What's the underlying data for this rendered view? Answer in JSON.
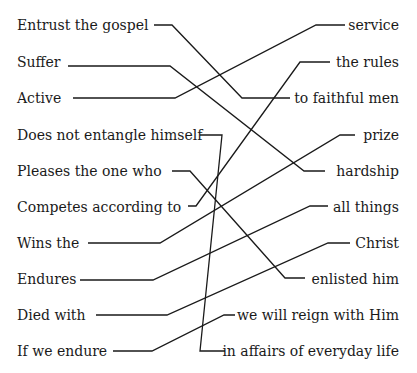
{
  "left_items": [
    {
      "label": "Entrust the gospel",
      "y": 17
    },
    {
      "label": "Suffer",
      "y": 54
    },
    {
      "label": "Active",
      "y": 90
    },
    {
      "label": "Does not entangle himself",
      "y": 127
    },
    {
      "label": "Pleases the one who",
      "y": 163
    },
    {
      "label": "Competes according to",
      "y": 199
    },
    {
      "label": "Wins the",
      "y": 235
    },
    {
      "label": "Endures",
      "y": 271
    },
    {
      "label": "Died with",
      "y": 307
    },
    {
      "label": "If we endure",
      "y": 343
    }
  ],
  "right_items": [
    {
      "label": "service",
      "y": 17
    },
    {
      "label": "the rules",
      "y": 54
    },
    {
      "label": "to faithful men",
      "y": 90
    },
    {
      "label": "prize",
      "y": 127
    },
    {
      "label": "hardship",
      "y": 163
    },
    {
      "label": "all things",
      "y": 199
    },
    {
      "label": "Christ",
      "y": 235
    },
    {
      "label": "enlisted him",
      "y": 271
    },
    {
      "label": "we will reign with Him",
      "y": 307
    },
    {
      "label": "in affairs of everyday life",
      "y": 343
    }
  ],
  "connections": [
    {
      "from": "Entrust the gospel",
      "to": "to faithful men"
    },
    {
      "from": "Suffer",
      "to": "hardship"
    },
    {
      "from": "Active",
      "to": "service"
    },
    {
      "from": "Does not entangle himself",
      "to": "in affairs of everyday life"
    },
    {
      "from": "Pleases the one who",
      "to": "enlisted him"
    },
    {
      "from": "Competes according to",
      "to": "the rules"
    },
    {
      "from": "Wins the",
      "to": "prize"
    },
    {
      "from": "Endures",
      "to": "all things"
    },
    {
      "from": "Died with",
      "to": "Christ"
    },
    {
      "from": "If we endure",
      "to": "we will reign with Him"
    }
  ]
}
